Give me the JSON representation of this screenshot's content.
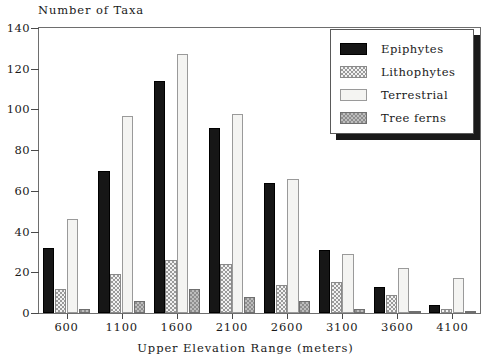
{
  "chart_data": {
    "type": "bar",
    "title": "",
    "ylabel": "Number of Taxa",
    "xlabel": "Upper Elevation Range (meters)",
    "categories": [
      "600",
      "1100",
      "1600",
      "2100",
      "2600",
      "3100",
      "3600",
      "4100"
    ],
    "ylim": [
      0,
      140
    ],
    "yticks": [
      0,
      20,
      40,
      60,
      80,
      100,
      120,
      140
    ],
    "grid": false,
    "legend_position": "top-right",
    "series": [
      {
        "name": "Epiphytes",
        "values": [
          32,
          70,
          114,
          91,
          64,
          31,
          13,
          4
        ]
      },
      {
        "name": "Lithophytes",
        "values": [
          12,
          19,
          26,
          24,
          14,
          15,
          9,
          2
        ]
      },
      {
        "name": "Terrestrial",
        "values": [
          46,
          97,
          127,
          98,
          66,
          29,
          22,
          17
        ]
      },
      {
        "name": "Tree ferns",
        "values": [
          2,
          6,
          12,
          8,
          6,
          2,
          1,
          1
        ]
      }
    ]
  },
  "legend": {
    "items": [
      {
        "label": "Epiphytes",
        "swatch": "solid-black-swatch"
      },
      {
        "label": "Lithophytes",
        "swatch": "light-checker-swatch"
      },
      {
        "label": "Terrestrial",
        "swatch": "white-swatch"
      },
      {
        "label": "Tree ferns",
        "swatch": "gray-checker-swatch"
      }
    ]
  },
  "colors": {
    "epiphytes": "#161616",
    "lithophytes": "#f2f2f2",
    "terrestrial": "#f4f4f2",
    "tree_ferns": "#8e8e8e",
    "axis": "#4a4a4a",
    "frame": "#6e6e6e",
    "text": "#1a1a1a",
    "background": "#ffffff"
  }
}
